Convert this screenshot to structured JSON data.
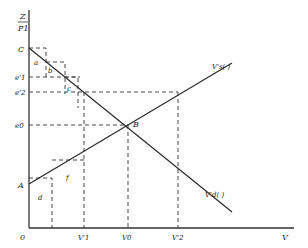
{
  "diagram": {
    "y_axis_label_top": "Z",
    "y_axis_label_bottom": "P1",
    "x_axis_label": "V",
    "origin_label": "0",
    "points": {
      "C": "C",
      "A": "A",
      "B": "B"
    },
    "y_ticks": [
      "e'1",
      "e'2",
      "e0"
    ],
    "x_ticks": [
      "V'1",
      "V0",
      "V'2"
    ],
    "regions": [
      "a",
      "b",
      "c",
      "d",
      "f"
    ],
    "curves": {
      "supply": "V's(  )",
      "demand": "V'd(  )"
    }
  }
}
